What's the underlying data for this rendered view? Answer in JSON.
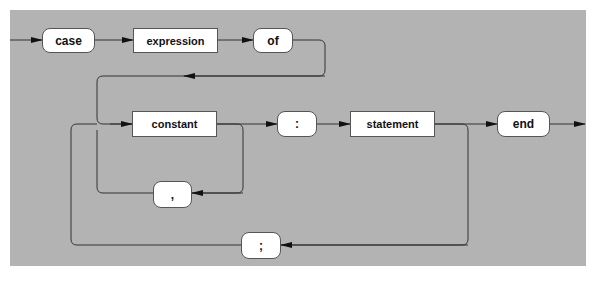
{
  "diagram": {
    "background_color": "#b3b3b3",
    "nodes": {
      "case": {
        "label": "case",
        "kind": "terminal"
      },
      "expression": {
        "label": "expression",
        "kind": "nonterminal"
      },
      "of": {
        "label": "of",
        "kind": "terminal"
      },
      "constant": {
        "label": "constant",
        "kind": "nonterminal"
      },
      "colon": {
        "label": ":",
        "kind": "terminal"
      },
      "statement": {
        "label": "statement",
        "kind": "nonterminal"
      },
      "end": {
        "label": "end",
        "kind": "terminal"
      },
      "comma": {
        "label": ",",
        "kind": "terminal"
      },
      "semicolon": {
        "label": ";",
        "kind": "terminal"
      }
    },
    "edges": [
      {
        "from": "start",
        "to": "case"
      },
      {
        "from": "case",
        "to": "expression"
      },
      {
        "from": "expression",
        "to": "of"
      },
      {
        "from": "of",
        "to": "constant"
      },
      {
        "from": "constant",
        "to": "colon"
      },
      {
        "from": "constant",
        "to": "comma"
      },
      {
        "from": "comma",
        "to": "constant"
      },
      {
        "from": "colon",
        "to": "statement"
      },
      {
        "from": "statement",
        "to": "end"
      },
      {
        "from": "statement",
        "to": "semicolon"
      },
      {
        "from": "semicolon",
        "to": "constant"
      },
      {
        "from": "end",
        "to": "exit"
      }
    ]
  }
}
